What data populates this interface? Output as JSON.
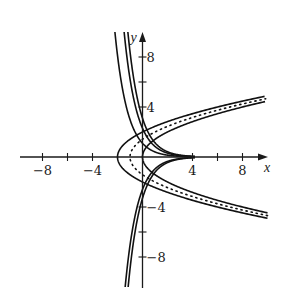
{
  "chart_data": {
    "type": "line",
    "title": "",
    "xlabel": "x",
    "ylabel": "y",
    "xlim": [
      -10.5,
      10
    ],
    "ylim": [
      -10.4,
      10
    ],
    "grid": false,
    "legend": null,
    "x_tick_values": [
      -8,
      -6,
      -4,
      4,
      6,
      8
    ],
    "x_tick_labels": [
      "−8",
      "",
      "−4",
      "4",
      "",
      "8"
    ],
    "y_tick_values": [
      8,
      6,
      4,
      -4,
      -6,
      -8
    ],
    "y_tick_labels": [
      "8",
      "",
      "4",
      "−4",
      "",
      "−8"
    ],
    "annotations": [],
    "series": [
      {
        "name": "parabola x = y²/2 − 2",
        "family": "parabola",
        "style": "solid",
        "a": 2,
        "c": -2
      },
      {
        "name": "parabola x = y²/2 − 1",
        "family": "parabola",
        "style": "dotted",
        "a": 2,
        "c": -1
      },
      {
        "name": "parabola x = y²/2",
        "family": "parabola",
        "style": "solid",
        "a": 2,
        "c": 0
      },
      {
        "name": "trajectory y = 1.1·e^(−x)",
        "family": "exponential",
        "style": "solid",
        "C": 1.1
      },
      {
        "name": "trajectory y = 2.3·e^(−x)",
        "family": "exponential",
        "style": "solid",
        "C": 2.3
      },
      {
        "name": "trajectory y = 3.1·e^(−x)",
        "family": "exponential",
        "style": "solid",
        "C": 3.1
      },
      {
        "name": "trajectory y = −2.6·e^(−x)",
        "family": "exponential",
        "style": "solid",
        "C": -2.6
      },
      {
        "name": "trajectory y = −3.3·e^(−x)",
        "family": "exponential",
        "style": "solid",
        "C": -3.3
      }
    ]
  },
  "plot_frame": {
    "origin_px": [
      142.5,
      157
    ],
    "scale_px_per_unit": 12.5,
    "x_axis_px": [
      20,
      268
    ],
    "y_axis_px": [
      32,
      288
    ]
  }
}
